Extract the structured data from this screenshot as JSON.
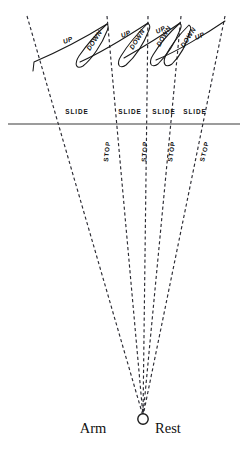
{
  "figure": {
    "background_color": "#ffffff",
    "ink_color": "#1a1a1a",
    "width": 249,
    "height": 465
  },
  "axis": {
    "left_label": "Arm",
    "right_label": "Rest",
    "pivot_icon": "pivot-circle-icon",
    "left_label_x": 93,
    "right_label_x": 168,
    "label_y": 433,
    "pivot_x": 143,
    "pivot_y": 419,
    "pivot_r": 5.2
  },
  "baseline": {
    "y": 124,
    "x_start": 8,
    "x_end": 240,
    "color": "#3a3a3a"
  },
  "slide_labels": [
    {
      "text": "SLIDE",
      "x": 77,
      "y": 114
    },
    {
      "text": "SLIDE",
      "x": 130,
      "y": 114
    },
    {
      "text": "SLIDE",
      "x": 164,
      "y": 114
    },
    {
      "text": "SLIDE",
      "x": 195,
      "y": 114
    }
  ],
  "stop_labels": [
    {
      "text": "STOP",
      "x": 108,
      "y": 162,
      "rotate": -84
    },
    {
      "text": "STOP",
      "x": 146,
      "y": 162,
      "rotate": -86
    },
    {
      "text": "STOP",
      "x": 172,
      "y": 162,
      "rotate": -81
    },
    {
      "text": "STOP",
      "x": 204,
      "y": 162,
      "rotate": -76
    }
  ],
  "up_labels": [
    {
      "text": "UP",
      "x": 64,
      "y": 44,
      "rotate": -20
    },
    {
      "text": "UP",
      "x": 122,
      "y": 38,
      "rotate": -22
    },
    {
      "text": "UP",
      "x": 157,
      "y": 34,
      "rotate": -26
    },
    {
      "text": "UP",
      "x": 196,
      "y": 40,
      "rotate": -24
    }
  ],
  "down_labels": [
    {
      "text": "DOWN",
      "x": 90,
      "y": 51,
      "rotate": -57
    },
    {
      "text": "DOWN",
      "x": 133,
      "y": 50,
      "rotate": -58
    },
    {
      "text": "DOWN",
      "x": 160,
      "y": 47,
      "rotate": -60
    },
    {
      "text": "DOWN",
      "x": 184,
      "y": 48,
      "rotate": -57
    }
  ],
  "fan_lines": [
    {
      "name": "fan-line-1",
      "x_top": 27,
      "y_top": 16,
      "x_bottom": 143,
      "y_bottom": 416
    },
    {
      "name": "fan-line-2",
      "x_top": 107,
      "y_top": 16,
      "x_bottom": 143,
      "y_bottom": 416
    },
    {
      "name": "fan-line-3",
      "x_top": 148,
      "y_top": 16,
      "x_bottom": 143,
      "y_bottom": 416
    },
    {
      "name": "fan-line-4",
      "x_top": 181,
      "y_top": 16,
      "x_bottom": 143,
      "y_bottom": 416
    },
    {
      "name": "fan-line-5",
      "x_top": 225,
      "y_top": 16,
      "x_bottom": 143,
      "y_bottom": 416
    }
  ],
  "curves": [
    {
      "name": "stroke-curve-1",
      "d": "M 33 71 L 34 62 C 48 56 78 42 107 24"
    },
    {
      "name": "stroke-curve-2",
      "d": "M 80 62 C 98 54 128 36 148 23"
    },
    {
      "name": "stroke-curve-3",
      "d": "M 124 58 C 138 50 164 34 180 23"
    },
    {
      "name": "stroke-curve-4",
      "d": "M 156 60 C 176 52 206 34 225 21"
    }
  ],
  "loops": [
    {
      "name": "return-loop-1",
      "d": "M 107 24 C 96 34 86 46 79 56 C 74 64 76 70 83 66 C 92 59 102 44 107 31 C 109 27 108 25 107 24 Z"
    },
    {
      "name": "return-loop-2",
      "d": "M 148 23 C 138 33 127 46 121 56 C 116 64 119 70 126 65 C 135 57 144 43 149 30 C 151 26 149 24 148 23 Z"
    },
    {
      "name": "return-loop-3",
      "d": "M 180 23 C 170 32 159 45 153 55 C 148 63 151 69 158 64 C 166 56 175 43 180 30 C 182 26 181 24 180 23 Z"
    },
    {
      "name": "return-loop-4",
      "d": "M 189 25 C 180 34 171 45 166 55 C 162 63 165 69 172 64 C 180 56 187 43 190 31 C 192 27 190 26 189 25 Z"
    }
  ]
}
